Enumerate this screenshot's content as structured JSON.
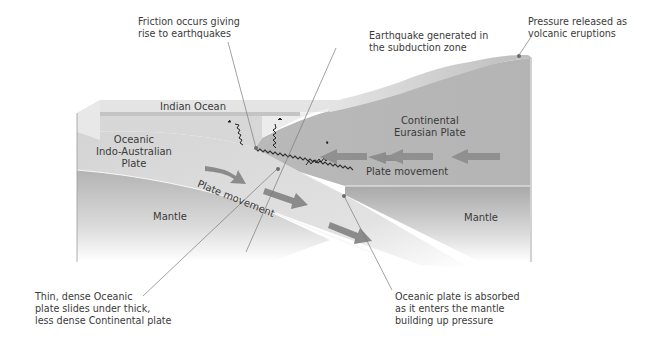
{
  "diagram": {
    "type": "subduction-zone-cross-section",
    "regions": {
      "ocean": "Indian Ocean",
      "oceanic_plate": [
        "Oceanic",
        "Indo-Australian",
        "Plate"
      ],
      "continental_plate": [
        "Continental",
        "Eurasian Plate"
      ],
      "mantle_left": "Mantle",
      "mantle_right": "Mantle",
      "plate_movement_oceanic": "Plate movement",
      "plate_movement_continental": "Plate movement"
    },
    "callouts": {
      "friction": [
        "Friction occurs giving",
        "rise to earthquakes"
      ],
      "earthquake": [
        "Earthquake generated in",
        "the subduction zone"
      ],
      "pressure": [
        "Pressure released as",
        "volcanic eruptions"
      ],
      "thin_dense": [
        "Thin, dense Oceanic",
        "plate slides under thick,",
        "less dense Continental plate"
      ],
      "absorbed": [
        "Oceanic plate is absorbed",
        "as it enters the mantle",
        "building up pressure"
      ]
    },
    "colors": {
      "ocean": "#d6d6d6",
      "ocean_top": "#e4e4e4",
      "oceanic_plate": "#cfcfcf",
      "continental_plate": "#b8b8b8",
      "mantle": "#b4b4b4",
      "arrow": "#8a8a8a",
      "text": "#3a3a3a",
      "leader_line": "#7a7a7a"
    }
  }
}
